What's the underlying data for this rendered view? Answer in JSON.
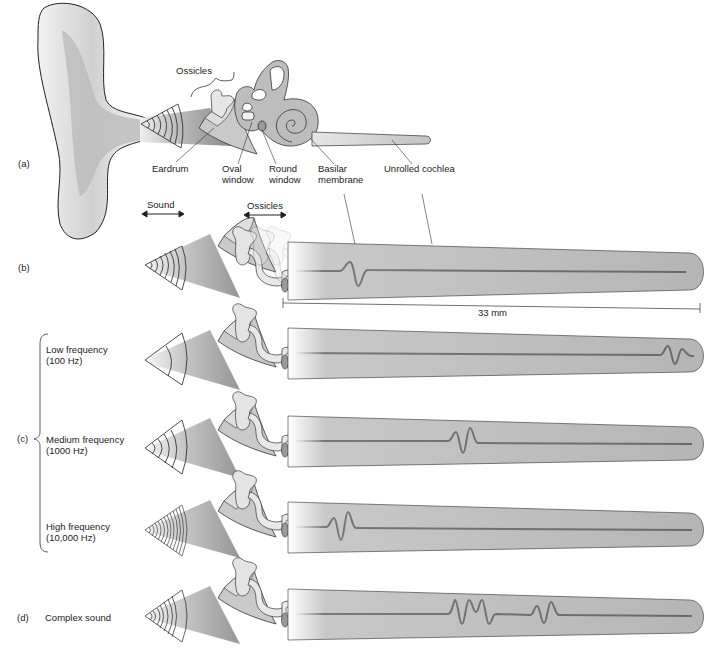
{
  "figure": {
    "panels": {
      "a": {
        "letter": "(a)",
        "labels": {
          "ossicles": "Ossicles",
          "eardrum": "Eardrum",
          "oval_window_1": "Oval",
          "oval_window_2": "window",
          "round_window_1": "Round",
          "round_window_2": "window",
          "basilar_1": "Basilar",
          "basilar_2": "membrane",
          "unrolled": "Unrolled cochlea"
        }
      },
      "b": {
        "letter": "(b)",
        "sound_label": "Sound",
        "ossicles_label": "Ossicles",
        "scale_label": "33 mm"
      },
      "c": {
        "letter": "(c)",
        "rows": [
          {
            "line1": "Low frequency",
            "line2": "(100 Hz)"
          },
          {
            "line1": "Medium frequency",
            "line2": "(1000 Hz)"
          },
          {
            "line1": "High frequency",
            "line2": "(10,000 Hz)"
          }
        ]
      },
      "d": {
        "letter": "(d)",
        "label": "Complex sound"
      }
    },
    "colors": {
      "tube": "#b8b8b8",
      "membrane": "#6e6e6e",
      "outline": "#333333",
      "ear": "#d9d9d9"
    }
  }
}
